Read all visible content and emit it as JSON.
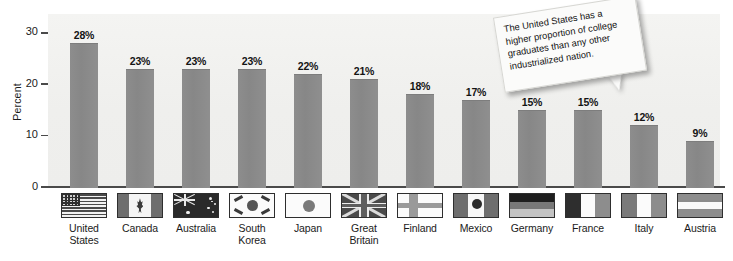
{
  "chart_data": {
    "type": "bar",
    "title": "",
    "xlabel": "",
    "ylabel": "Percent",
    "ylim": [
      0,
      32
    ],
    "yticks": [
      "0",
      "10",
      "20",
      "30"
    ],
    "ytick_values": [
      0,
      10,
      20,
      30
    ],
    "grid": false,
    "legend": "none",
    "categories": [
      "United States",
      "Canada",
      "Australia",
      "South Korea",
      "Japan",
      "Great Britain",
      "Finland",
      "Mexico",
      "Germany",
      "France",
      "Italy",
      "Austria"
    ],
    "category_lines": [
      [
        "United",
        "States"
      ],
      [
        "Canada"
      ],
      [
        "Australia"
      ],
      [
        "South",
        "Korea"
      ],
      [
        "Japan"
      ],
      [
        "Great",
        "Britain"
      ],
      [
        "Finland"
      ],
      [
        "Mexico"
      ],
      [
        "Germany"
      ],
      [
        "France"
      ],
      [
        "Italy"
      ],
      [
        "Austria"
      ]
    ],
    "values": [
      28,
      23,
      23,
      23,
      22,
      21,
      18,
      17,
      15,
      15,
      12,
      9
    ],
    "data_labels": [
      "28%",
      "23%",
      "23%",
      "23%",
      "22%",
      "21%",
      "18%",
      "17%",
      "15%",
      "15%",
      "12%",
      "9%"
    ],
    "bar_color": "#8a8a8a",
    "plot_background": "#f1f1ef",
    "axis_color": "#4a4a4a"
  },
  "annotation": {
    "text": "The United States has a higher proportion of college graduates than any other industrialized nation."
  },
  "flags": {
    "names": [
      "flag-united-states",
      "flag-canada",
      "flag-australia",
      "flag-south-korea",
      "flag-japan",
      "flag-great-britain",
      "flag-finland",
      "flag-mexico",
      "flag-germany",
      "flag-france",
      "flag-italy",
      "flag-austria"
    ]
  }
}
